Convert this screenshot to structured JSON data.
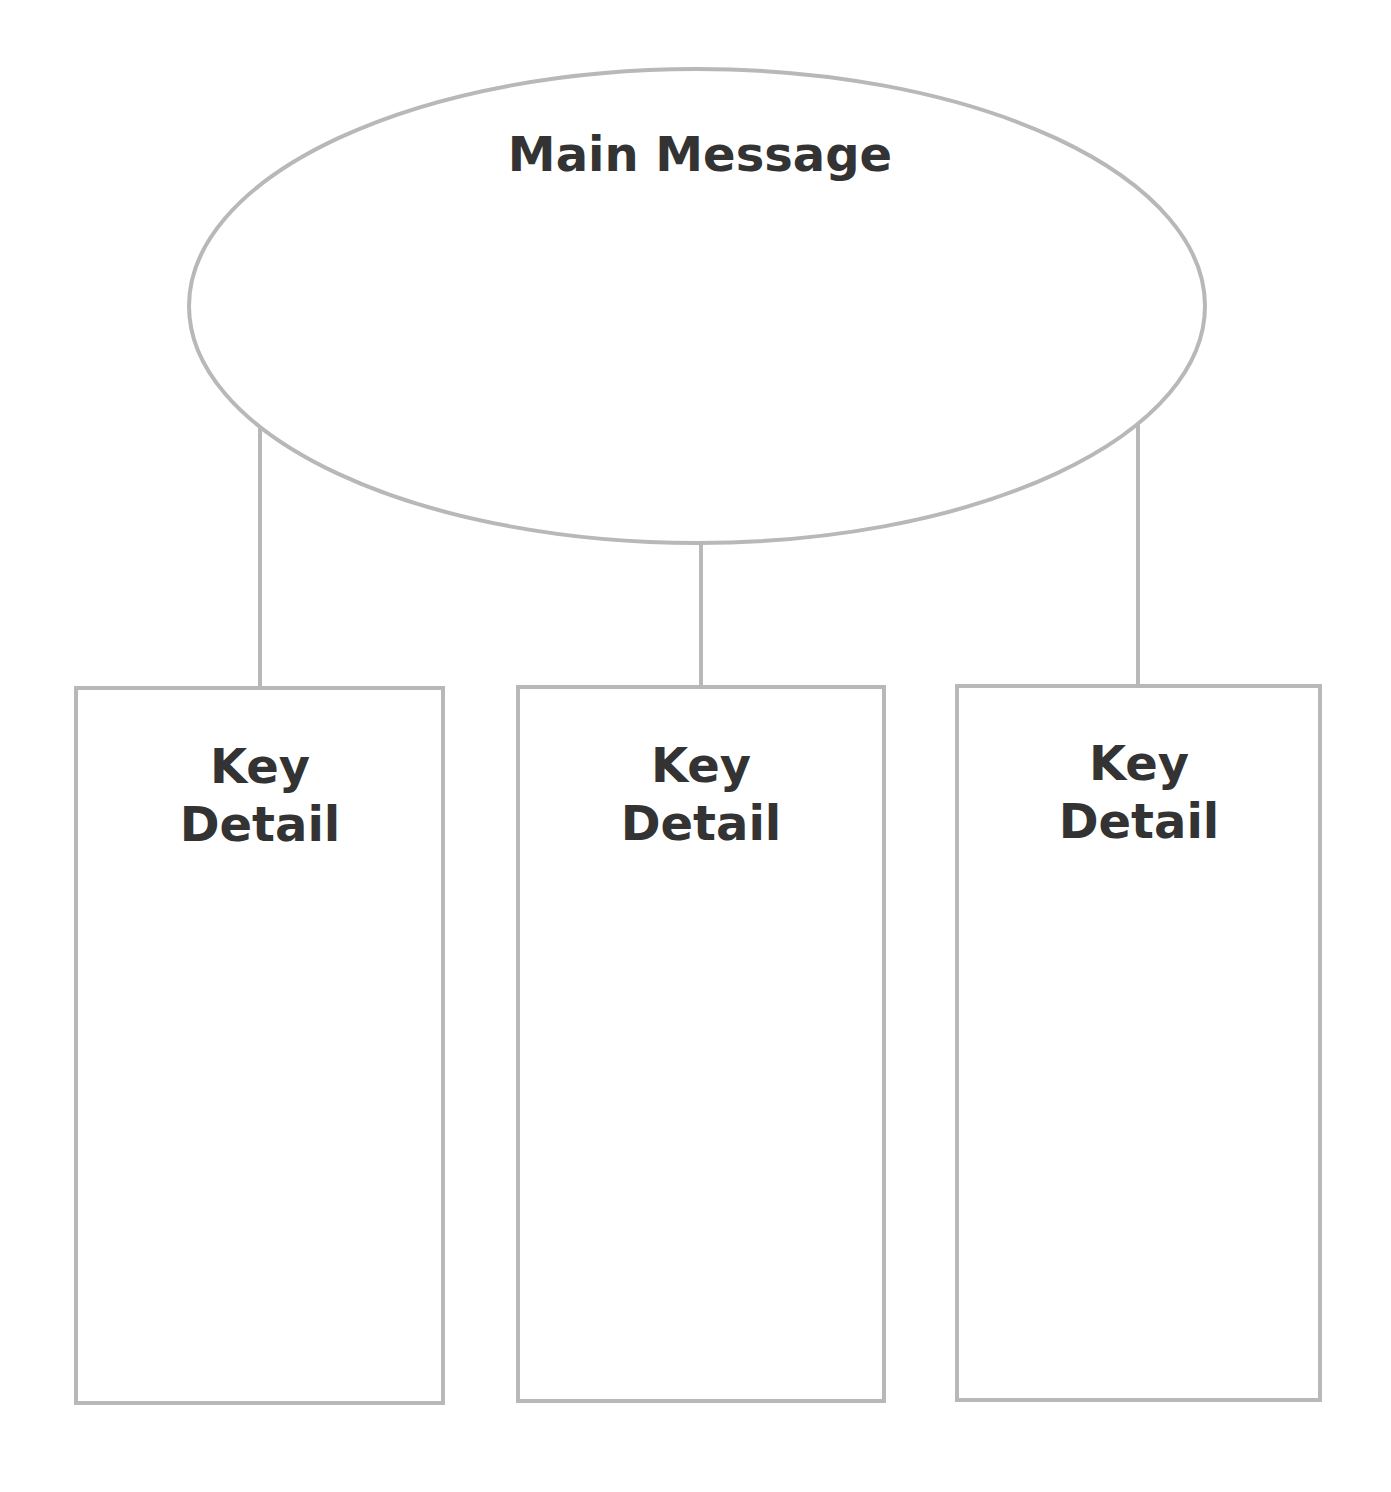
{
  "diagram": {
    "main": {
      "title": "Main Message"
    },
    "details": [
      {
        "line1": "Key",
        "line2": "Detail"
      },
      {
        "line1": "Key",
        "line2": "Detail"
      },
      {
        "line1": "Key",
        "line2": "Detail"
      }
    ],
    "colors": {
      "stroke": "#b8b8b8",
      "text": "#333333",
      "background": "#ffffff"
    }
  }
}
